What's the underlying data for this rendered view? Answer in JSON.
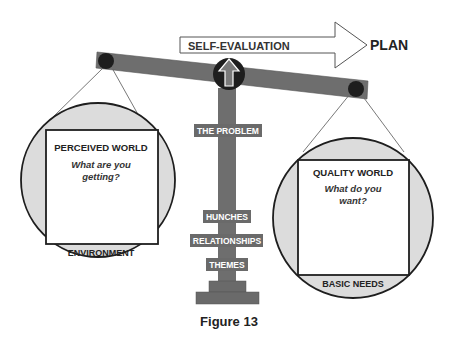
{
  "figure": {
    "caption": "Figure 13"
  },
  "arrow": {
    "label": "SELF-EVALUATION",
    "target": "PLAN"
  },
  "fulcrum": {
    "icon": "up-arrow-icon"
  },
  "column": {
    "labels": [
      "THE PROBLEM",
      "HUNCHES",
      "RELATIONSHIPS",
      "THEMES"
    ]
  },
  "left_pan": {
    "title": "PERCEIVED WORLD",
    "question_line1": "What are you",
    "question_line2": "getting?",
    "footer": "ENVIRONMENT"
  },
  "right_pan": {
    "title": "QUALITY WORLD",
    "question_line1": "What do you",
    "question_line2": "want?",
    "footer": "BASIC NEEDS"
  },
  "colors": {
    "beam": "#6e6e6e",
    "pivot": "#1e1e1e",
    "pan_fill": "#dcdcdc",
    "label_bg": "#6a6a6a",
    "text": "#222222"
  }
}
